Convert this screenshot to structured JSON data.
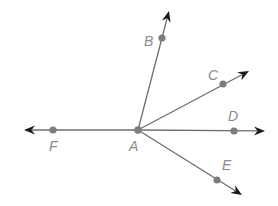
{
  "diagram": {
    "type": "geometry-rays",
    "vertex": {
      "label": "A",
      "x": 138,
      "y": 130,
      "label_x": 129,
      "label_y": 151
    },
    "colors": {
      "line": "#6e6e6e",
      "arrow": "#1a1a1a",
      "point": "#7d7d7d",
      "label": "#8a8a8a"
    },
    "rays": [
      {
        "label": "B",
        "point": {
          "x": 162,
          "y": 38
        },
        "tip": {
          "x": 169,
          "y": 11
        },
        "label_x": 144,
        "label_y": 46
      },
      {
        "label": "C",
        "point": {
          "x": 223,
          "y": 84
        },
        "tip": {
          "x": 249,
          "y": 71
        },
        "label_x": 208,
        "label_y": 80
      },
      {
        "label": "D",
        "point": {
          "x": 234,
          "y": 131
        },
        "tip": {
          "x": 265,
          "y": 131
        },
        "label_x": 228,
        "label_y": 121
      },
      {
        "label": "E",
        "point": {
          "x": 217,
          "y": 180
        },
        "tip": {
          "x": 242,
          "y": 195
        },
        "label_x": 222,
        "label_y": 170
      },
      {
        "label": "F",
        "point": {
          "x": 53,
          "y": 130
        },
        "tip": {
          "x": 24,
          "y": 130
        },
        "label_x": 49,
        "label_y": 151
      }
    ]
  }
}
